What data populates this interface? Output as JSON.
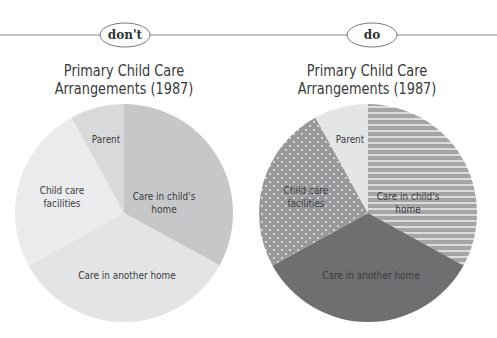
{
  "panels": [
    {
      "id": "dont",
      "tag": "don't",
      "title_line1": "Primary Child Care",
      "title_line2": "Arrangements (1987)",
      "slices": [
        {
          "label_lines": [
            "Care in child's",
            "home"
          ],
          "fill": "#c6c7c9"
        },
        {
          "label_lines": [
            "Care in another home"
          ],
          "fill": "#e3e4e6"
        },
        {
          "label_lines": [
            "Child care",
            "facilities"
          ],
          "fill": "#eaebec"
        },
        {
          "label_lines": [
            "Parent"
          ],
          "fill": "#d8d9db"
        }
      ]
    },
    {
      "id": "do",
      "tag": "do",
      "title_line1": "Primary Child Care",
      "title_line2": "Arrangements (1987)",
      "slices": [
        {
          "label_lines": [
            "Care in child's",
            "home"
          ],
          "fill": "url(#stripes)"
        },
        {
          "label_lines": [
            "Care in another home"
          ],
          "fill": "#6e6f71"
        },
        {
          "label_lines": [
            "Child care",
            "facilities"
          ],
          "fill": "url(#dots)"
        },
        {
          "label_lines": [
            "Parent"
          ],
          "fill": "#e4e5e7"
        }
      ]
    }
  ],
  "chart_data": [
    {
      "type": "pie",
      "title": "Primary Child Care Arrangements (1987)",
      "panel_tag": "don't",
      "categories": [
        "Care in child's home",
        "Care in another home",
        "Child care facilities",
        "Parent"
      ],
      "values": [
        33,
        34,
        25,
        8
      ],
      "colors": [
        "#c6c7c9",
        "#e3e4e6",
        "#eaebec",
        "#d8d9db"
      ],
      "start_angle_deg": 0,
      "direction": "clockwise",
      "legend": "none (direct labels)"
    },
    {
      "type": "pie",
      "title": "Primary Child Care Arrangements (1987)",
      "panel_tag": "do",
      "categories": [
        "Care in child's home",
        "Care in another home",
        "Child care facilities",
        "Parent"
      ],
      "values": [
        33,
        34,
        25,
        8
      ],
      "colors": [
        "#a4a5a7 (horizontal stripes)",
        "#6e6f71",
        "#97989a (white dots)",
        "#e4e5e7"
      ],
      "start_angle_deg": 0,
      "direction": "clockwise",
      "legend": "none (direct labels)"
    }
  ]
}
